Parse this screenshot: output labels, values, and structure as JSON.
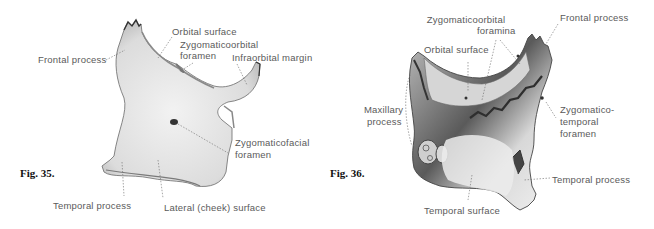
{
  "figures": [
    {
      "id": "fig35",
      "caption": "Fig. 35.",
      "labels": {
        "frontal_process": "Frontal process",
        "orbital_surface": "Orbital surface",
        "zygomaticoorbital_foramen_1": "Zygomaticoorbital",
        "zygomaticoorbital_foramen_2": "foramen",
        "infraorbital_margin": "Infraorbital margin",
        "zygomaticofacial_foramen_1": "Zygomaticofacial",
        "zygomaticofacial_foramen_2": "foramen",
        "temporal_process": "Temporal process",
        "lateral_surface": "Lateral (cheek) surface"
      }
    },
    {
      "id": "fig36",
      "caption": "Fig. 36.",
      "labels": {
        "zygomaticoorbital_foramina_1": "Zygomaticoorbital",
        "zygomaticoorbital_foramina_2": "foramina",
        "frontal_process": "Frontal process",
        "orbital_surface": "Orbital surface",
        "maxillary_process_1": "Maxillary",
        "maxillary_process_2": "process",
        "zygomaticotemporal_foramen_1": "Zygomatico-",
        "zygomaticotemporal_foramen_2": "temporal",
        "zygomaticotemporal_foramen_3": "foramen",
        "temporal_process": "Temporal process",
        "temporal_surface": "Temporal surface"
      }
    }
  ]
}
